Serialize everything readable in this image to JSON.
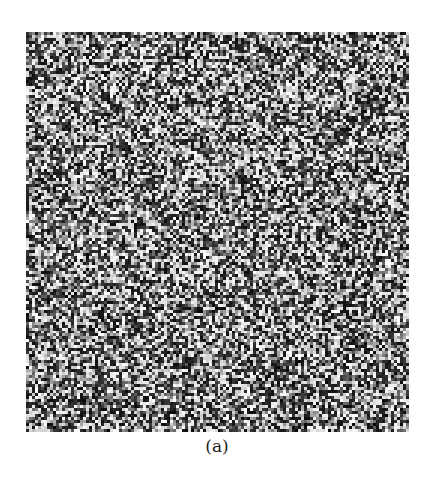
{
  "figure": {
    "caption": "(a)",
    "panel": {
      "type": "random-noise-image",
      "description": "Grayscale speckle / random noise texture",
      "colors": {
        "dark": "#111111",
        "light": "#f2f2f2",
        "background": "#ffffff"
      },
      "grid": {
        "cols": 128,
        "rows": 134
      },
      "seed": 1337
    }
  }
}
